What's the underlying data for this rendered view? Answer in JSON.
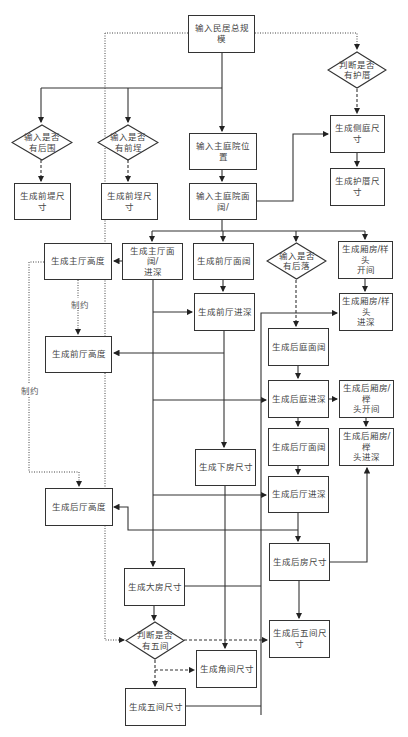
{
  "nodes": {
    "total_scale": "输入民居总规模",
    "has_hucuo": "判断是否\n有护厝",
    "has_houwei": "输入是否\n有后围",
    "has_qiancheng": "输入是否\n有前埕",
    "qiandi_size": "生成前堤尺寸",
    "qiancheng_size": "生成前埕尺寸",
    "main_court_pos": "输入主庭院位置",
    "main_court_width": "输入主庭院面\n阔/",
    "side_court_size": "生成侧庭尺寸",
    "hucuo_size": "生成护厝尺寸",
    "main_hall_height": "生成主厅高度",
    "main_hall_wd": "生成主厅面阔/\n进深",
    "front_hall_width": "生成前厅面阔",
    "has_houluo": "输入是否\n有后落",
    "wing_bay": "生成厢房/样头\n开间",
    "front_hall_depth": "生成前厅进深",
    "wing_depth": "生成厢房/样头\n进深",
    "front_hall_height": "生成前厅高度",
    "rear_court_width": "生成后庭面阔",
    "rear_court_depth": "生成后庭进深",
    "rear_wing_bay": "生成后厢房/榉\n头开间",
    "rear_hall_width": "生成后厅面阔",
    "rear_wing_depth": "生成后厢房/榉\n头进深",
    "lower_room_size": "生成下房尺寸",
    "rear_hall_depth": "生成后厅进深",
    "rear_hall_height": "生成后厅高度",
    "rear_room_size": "生成后房尺寸",
    "big_room_size": "生成大房尺寸",
    "has_five_bay": "判断是否\n有五间",
    "rear_five_bay_size": "生成后五间尺寸",
    "corner_room_size": "生成角间尺寸",
    "five_bay_size": "生成五间尺寸"
  },
  "labels": {
    "constraint_1": "制约",
    "constraint_2": "制约"
  },
  "colors": {
    "line": "#333333",
    "text": "#444444",
    "background": "#ffffff"
  }
}
